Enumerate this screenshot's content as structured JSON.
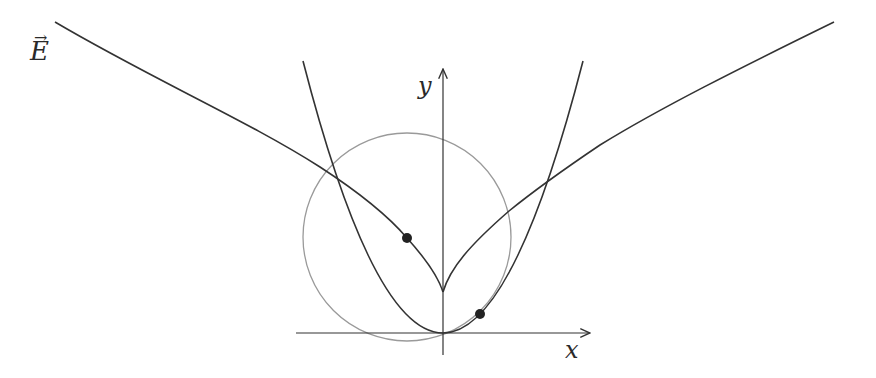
{
  "labels": {
    "field": "E",
    "field_arrow": "→",
    "y_axis": "y",
    "x_axis": "x"
  },
  "colors": {
    "curve": "#333333",
    "circle": "#999999",
    "axes": "#333333",
    "point": "#222222",
    "background": "#ffffff"
  },
  "geometry": {
    "origin": [
      443,
      333
    ],
    "x_axis": {
      "from": [
        296,
        333
      ],
      "to": [
        591,
        333
      ]
    },
    "y_axis": {
      "from": [
        443,
        355
      ],
      "to": [
        443,
        68
      ]
    },
    "circle": {
      "center": [
        407,
        237
      ],
      "radius": 104
    },
    "parabola": {
      "vertex": [
        443,
        333
      ],
      "left_top": [
        303,
        61
      ],
      "right_top": [
        583,
        61
      ]
    },
    "field_curve": {
      "cusp": [
        443,
        292
      ],
      "left_end": [
        55,
        22
      ],
      "right_end": [
        834,
        22
      ]
    },
    "points": [
      {
        "name": "circle-center-point",
        "pos": [
          407,
          238
        ]
      },
      {
        "name": "tangent-point",
        "pos": [
          480,
          314
        ]
      }
    ]
  }
}
